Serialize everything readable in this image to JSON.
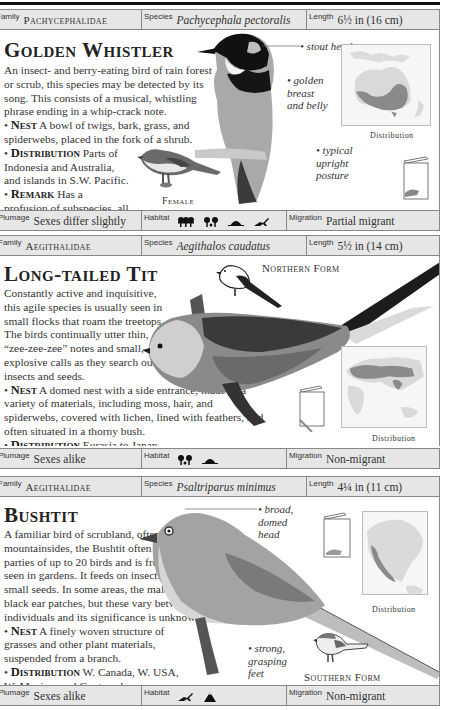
{
  "entries": [
    {
      "family_label": "Family",
      "family": "Pachycephalidae",
      "species_label": "Species",
      "species": "Pachycephala pectoralis",
      "length_label": "Length",
      "length": "6½ in (16 cm)",
      "title": "Golden Whistler",
      "description": "An insect- and berry-eating bird of rain forest or scrub, this species may be detected by its song. This consists of a musical, whistling phrase ending in a whip-crack note.",
      "nest_label": "Nest",
      "nest": "A bowl of twigs, bark, grass, and spiderwebs, placed in the fork of a shrub.",
      "distribution_label": "Distribution",
      "distribution": "Parts of Indonesia and Australia, and islands in S.W. Pacific.",
      "remark_label": "Remark",
      "remark": "Has a profusion of subspecies, all with different colors.",
      "annotations": [
        "stout head",
        "golden breast and belly",
        "typical upright posture"
      ],
      "inset_caption": "Female",
      "map_caption": "Distribution",
      "plumage_label": "Plumage",
      "plumage": "Sexes differ slightly",
      "habitat_label": "Habitat",
      "habitat_icons": [
        "rainforest-icon",
        "woodland-icon",
        "scrub-icon",
        "grassland-icon"
      ],
      "migration_label": "Migration",
      "migration": "Partial migrant"
    },
    {
      "family_label": "Family",
      "family": "Aegithalidae",
      "species_label": "Species",
      "species": "Aegithalos caudatus",
      "length_label": "Length",
      "length": "5½ in (14 cm)",
      "title": "Long-tailed Tit",
      "description": "Constantly active and inquisitive, this agile species is usually seen in small flocks that roam the treetops. The birds continually utter thin, “zee-zee-zee” notes and small, explosive calls as they search out insects and seeds.",
      "nest_label": "Nest",
      "nest": "A domed nest with a side entrance, made of a variety of materials, including moss, hair, and spiderwebs, covered with lichen, lined with feathers, and often situated in a thorny bush.",
      "distribution_label": "Distribution",
      "distribution": "Eurasia to Japan.",
      "inset_caption": "Northern Form",
      "map_caption": "Distribution",
      "plumage_label": "Plumage",
      "plumage": "Sexes alike",
      "habitat_label": "Habitat",
      "habitat_icons": [
        "woodland-icon",
        "scrub-icon"
      ],
      "migration_label": "Migration",
      "migration": "Non-migrant"
    },
    {
      "family_label": "Family",
      "family": "Aegithalidae",
      "species_label": "Species",
      "species": "Psaltriparus minimus",
      "length_label": "Length",
      "length": "4¼ in (11 cm)",
      "title": "Bushtit",
      "description": "A familiar bird of scrubland, often on mountainsides, the Bushtit often forms parties of up to 20 birds and is frequently seen in gardens. It feeds on insects and small seeds. In some areas, the male has black ear patches, but these vary between individuals and its significance is unknown.",
      "nest_label": "Nest",
      "nest": "A finely woven structure of grasses and other plant materials, suspended from a branch.",
      "distribution_label": "Distribution",
      "distribution": "W. Canada, W. USA, W. Mexico, and Guatemala.",
      "annotations": [
        "broad, domed head",
        "strong, grasping feet"
      ],
      "inset_caption": "Southern Form",
      "map_caption": "Distribution",
      "plumage_label": "Plumage",
      "plumage": "Sexes alike",
      "habitat_label": "Habitat",
      "habitat_icons": [
        "grassland-icon",
        "mountain-icon"
      ],
      "migration_label": "Migration",
      "migration": "Non-migrant"
    }
  ],
  "colors": {
    "bar_bg": "#e6e6e6",
    "map_range": "#8a8a8a",
    "map_land": "#d9d9d9"
  }
}
